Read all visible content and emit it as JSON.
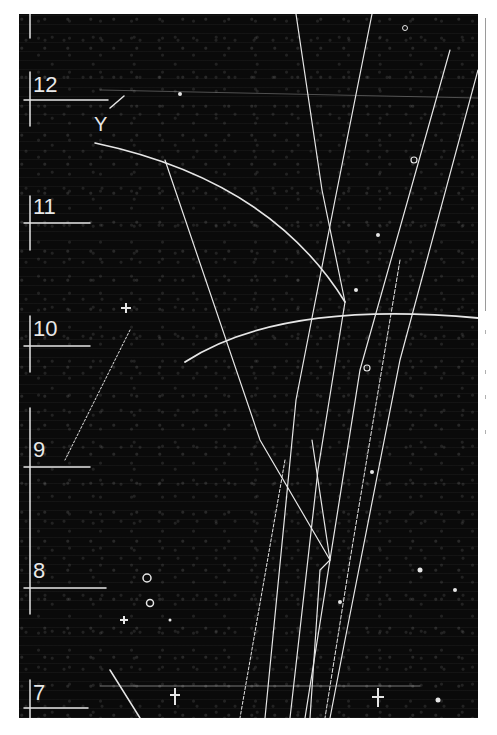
{
  "image": {
    "subject": "bubble chamber photograph with particle tracks",
    "scale_labels": [
      {
        "label": "12",
        "y": 83
      },
      {
        "label": "11",
        "y": 205
      },
      {
        "label": "10",
        "y": 327
      },
      {
        "label": "9",
        "y": 448
      },
      {
        "label": "8",
        "y": 570
      },
      {
        "label": "7",
        "y": 693
      }
    ],
    "annotation_y": "Y",
    "colors": {
      "background": "#0a0a0a",
      "track": "#e6e6e6",
      "page": "#ffffff"
    }
  }
}
